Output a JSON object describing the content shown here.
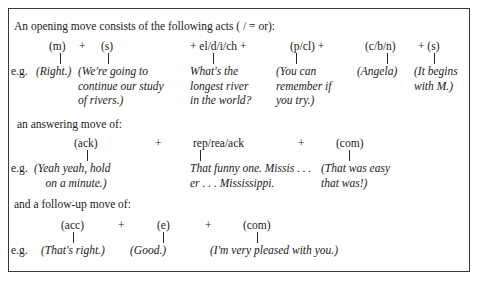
{
  "opening": {
    "heading": "An opening move consists of the following acts ( / = or):",
    "eg": "e.g.",
    "acts": [
      {
        "label": "(m)"
      },
      {
        "label": "+"
      },
      {
        "label": "(s)"
      },
      {
        "label": "+ el/d/i/ch +"
      },
      {
        "label": "(p/cl) +"
      },
      {
        "label": "(c/b/n)"
      },
      {
        "label": "+ (s)"
      }
    ],
    "examples": [
      {
        "text": "(Right.)"
      },
      {
        "text": "(We're going to\ncontinue our study\nof rivers.)"
      },
      {
        "text": "What's the\nlongest river\nin the world?"
      },
      {
        "text": "(You can\nremember if\nyou try.)"
      },
      {
        "text": "(Angela)"
      },
      {
        "text": "(It begins\nwith M.)"
      }
    ]
  },
  "answering": {
    "heading": "an answering move of:",
    "eg": "e.g.",
    "acts": [
      {
        "label": "(ack)"
      },
      {
        "label": "+"
      },
      {
        "label": "rep/rea/ack"
      },
      {
        "label": "+"
      },
      {
        "label": "(com)"
      }
    ],
    "examples": [
      {
        "text": "(Yeah yeah, hold\n    on a minute.)"
      },
      {
        "text": "That funny one. Missis . . .\ner . . . Mississippi."
      },
      {
        "text": "(That was easy\nthat was!)"
      }
    ]
  },
  "followup": {
    "heading": "and a follow-up move of:",
    "eg": "e.g.",
    "acts": [
      {
        "label": "(acc)"
      },
      {
        "label": "+"
      },
      {
        "label": "(e)"
      },
      {
        "label": "+"
      },
      {
        "label": "(com)"
      }
    ],
    "examples": [
      {
        "text": "(That's right.)"
      },
      {
        "text": "(Good.)"
      },
      {
        "text": "(I'm very pleased with you.)"
      }
    ]
  }
}
